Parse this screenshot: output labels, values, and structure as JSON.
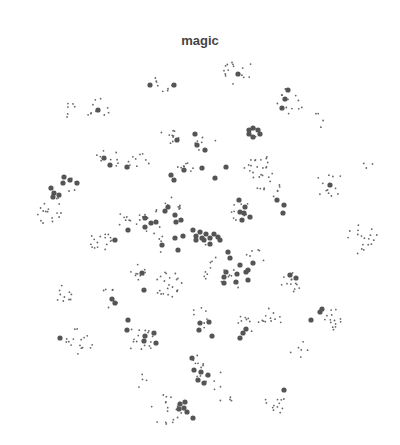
{
  "chart_data": {
    "type": "scatter",
    "title": "magic",
    "xlabel": "",
    "ylabel": "",
    "grid": false,
    "legend": null,
    "axes_visible": false,
    "colors": {
      "small_point": "#666666",
      "large_point": "#555555"
    },
    "clusters": [
      {
        "cx": 236,
        "cy": 70,
        "n": 16,
        "spread": 16,
        "large": [
          [
            238,
            74
          ]
        ]
      },
      {
        "cx": 162,
        "cy": 80,
        "n": 8,
        "spread": 12,
        "large": [
          [
            150,
            85
          ],
          [
            174,
            85
          ]
        ]
      },
      {
        "cx": 100,
        "cy": 110,
        "n": 10,
        "spread": 14,
        "large": [
          [
            98,
            110
          ]
        ]
      },
      {
        "cx": 68,
        "cy": 110,
        "n": 6,
        "spread": 8,
        "large": []
      },
      {
        "cx": 290,
        "cy": 100,
        "n": 12,
        "spread": 14,
        "large": [
          [
            288,
            90
          ],
          [
            285,
            99
          ],
          [
            282,
            108
          ]
        ]
      },
      {
        "cx": 320,
        "cy": 120,
        "n": 4,
        "spread": 8,
        "large": []
      },
      {
        "cx": 172,
        "cy": 135,
        "n": 10,
        "spread": 12,
        "large": [
          [
            177,
            140
          ]
        ]
      },
      {
        "cx": 205,
        "cy": 140,
        "n": 6,
        "spread": 12,
        "large": [
          [
            195,
            134
          ],
          [
            197,
            145
          ],
          [
            205,
            150
          ]
        ]
      },
      {
        "cx": 256,
        "cy": 133,
        "n": 2,
        "spread": 6,
        "large": [
          [
            249,
            130
          ],
          [
            253,
            128
          ],
          [
            258,
            130
          ],
          [
            260,
            134
          ],
          [
            253,
            137
          ],
          [
            249,
            134
          ]
        ]
      },
      {
        "cx": 108,
        "cy": 158,
        "n": 10,
        "spread": 12,
        "large": [
          [
            104,
            158
          ],
          [
            110,
            165
          ]
        ]
      },
      {
        "cx": 140,
        "cy": 165,
        "n": 10,
        "spread": 12,
        "large": [
          [
            127,
            167
          ]
        ]
      },
      {
        "cx": 258,
        "cy": 165,
        "n": 20,
        "spread": 14,
        "large": [
          [
            226,
            167
          ]
        ]
      },
      {
        "cx": 185,
        "cy": 165,
        "n": 8,
        "spread": 10,
        "large": [
          [
            171,
            175
          ],
          [
            174,
            180
          ],
          [
            184,
            170
          ],
          [
            202,
            168
          ],
          [
            215,
            178
          ]
        ]
      },
      {
        "cx": 330,
        "cy": 185,
        "n": 12,
        "spread": 14,
        "large": [
          [
            330,
            185
          ]
        ]
      },
      {
        "cx": 70,
        "cy": 185,
        "n": 4,
        "spread": 8,
        "large": [
          [
            64,
            177
          ],
          [
            70,
            180
          ],
          [
            77,
            183
          ],
          [
            63,
            183
          ]
        ]
      },
      {
        "cx": 368,
        "cy": 165,
        "n": 3,
        "spread": 6,
        "large": []
      },
      {
        "cx": 52,
        "cy": 210,
        "n": 18,
        "spread": 16,
        "large": [
          [
            51,
            188
          ],
          [
            54,
            193
          ],
          [
            53,
            197
          ],
          [
            59,
            195
          ]
        ]
      },
      {
        "cx": 130,
        "cy": 220,
        "n": 10,
        "spread": 14,
        "large": [
          [
            128,
            230
          ]
        ]
      },
      {
        "cx": 150,
        "cy": 220,
        "n": 8,
        "spread": 12,
        "large": [
          [
            145,
            218
          ],
          [
            151,
            223
          ],
          [
            145,
            227
          ],
          [
            156,
            222
          ]
        ]
      },
      {
        "cx": 175,
        "cy": 205,
        "n": 8,
        "spread": 10,
        "large": [
          [
            168,
            207
          ],
          [
            165,
            211
          ],
          [
            175,
            215
          ],
          [
            176,
            222
          ],
          [
            181,
            220
          ]
        ]
      },
      {
        "cx": 240,
        "cy": 210,
        "n": 10,
        "spread": 12,
        "large": [
          [
            239,
            200
          ],
          [
            245,
            207
          ],
          [
            244,
            213
          ],
          [
            250,
            217
          ],
          [
            242,
            220
          ],
          [
            240,
            212
          ]
        ]
      },
      {
        "cx": 270,
        "cy": 185,
        "n": 12,
        "spread": 14,
        "large": [
          [
            277,
            200
          ],
          [
            283,
            213
          ],
          [
            284,
            205
          ]
        ]
      },
      {
        "cx": 100,
        "cy": 240,
        "n": 16,
        "spread": 12,
        "large": [
          [
            115,
            240
          ]
        ]
      },
      {
        "cx": 205,
        "cy": 235,
        "n": 2,
        "spread": 10,
        "large": [
          [
            193,
            230
          ],
          [
            196,
            236
          ],
          [
            200,
            232
          ],
          [
            202,
            238
          ],
          [
            206,
            234
          ],
          [
            210,
            238
          ],
          [
            214,
            234
          ],
          [
            218,
            237
          ],
          [
            220,
            240
          ],
          [
            204,
            240
          ],
          [
            196,
            240
          ],
          [
            210,
            244
          ]
        ]
      },
      {
        "cx": 160,
        "cy": 240,
        "n": 6,
        "spread": 14,
        "large": [
          [
            162,
            245
          ],
          [
            175,
            238
          ],
          [
            183,
            236
          ],
          [
            178,
            250
          ]
        ]
      },
      {
        "cx": 362,
        "cy": 238,
        "n": 18,
        "spread": 16,
        "large": []
      },
      {
        "cx": 210,
        "cy": 268,
        "n": 8,
        "spread": 12,
        "large": [
          [
            228,
            252
          ],
          [
            230,
            258
          ],
          [
            226,
            272
          ],
          [
            246,
            272
          ]
        ]
      },
      {
        "cx": 255,
        "cy": 258,
        "n": 6,
        "spread": 10,
        "large": [
          [
            248,
            270
          ],
          [
            253,
            263
          ],
          [
            240,
            265
          ]
        ]
      },
      {
        "cx": 140,
        "cy": 270,
        "n": 10,
        "spread": 14,
        "large": [
          [
            142,
            273
          ],
          [
            144,
            290
          ]
        ]
      },
      {
        "cx": 168,
        "cy": 285,
        "n": 22,
        "spread": 14,
        "large": []
      },
      {
        "cx": 230,
        "cy": 280,
        "n": 8,
        "spread": 12,
        "large": [
          [
            224,
            277
          ],
          [
            237,
            274
          ],
          [
            224,
            283
          ],
          [
            236,
            282
          ],
          [
            248,
            280
          ]
        ]
      },
      {
        "cx": 292,
        "cy": 280,
        "n": 12,
        "spread": 12,
        "large": [
          [
            290,
            275
          ],
          [
            296,
            278
          ]
        ]
      },
      {
        "cx": 68,
        "cy": 295,
        "n": 10,
        "spread": 12,
        "large": []
      },
      {
        "cx": 110,
        "cy": 298,
        "n": 6,
        "spread": 10,
        "large": [
          [
            112,
            299
          ],
          [
            115,
            303
          ]
        ]
      },
      {
        "cx": 200,
        "cy": 318,
        "n": 8,
        "spread": 12,
        "large": [
          [
            200,
            323
          ],
          [
            209,
            322
          ],
          [
            199,
            330
          ],
          [
            212,
            336
          ]
        ]
      },
      {
        "cx": 243,
        "cy": 325,
        "n": 8,
        "spread": 12,
        "large": [
          [
            243,
            333
          ],
          [
            246,
            329
          ],
          [
            240,
            338
          ]
        ]
      },
      {
        "cx": 270,
        "cy": 320,
        "n": 12,
        "spread": 12,
        "large": []
      },
      {
        "cx": 335,
        "cy": 318,
        "n": 14,
        "spread": 12,
        "large": [
          [
            320,
            312
          ],
          [
            322,
            309
          ],
          [
            311,
            320
          ]
        ]
      },
      {
        "cx": 80,
        "cy": 340,
        "n": 16,
        "spread": 14,
        "large": [
          [
            60,
            338
          ]
        ]
      },
      {
        "cx": 140,
        "cy": 340,
        "n": 16,
        "spread": 14,
        "large": [
          [
            128,
            320
          ],
          [
            127,
            330
          ],
          [
            145,
            336
          ],
          [
            154,
            333
          ],
          [
            144,
            341
          ],
          [
            156,
            343
          ]
        ]
      },
      {
        "cx": 215,
        "cy": 380,
        "n": 6,
        "spread": 10,
        "large": []
      },
      {
        "cx": 300,
        "cy": 350,
        "n": 6,
        "spread": 10,
        "large": []
      },
      {
        "cx": 196,
        "cy": 365,
        "n": 10,
        "spread": 12,
        "large": [
          [
            192,
            358
          ],
          [
            194,
            370
          ],
          [
            201,
            372
          ],
          [
            208,
            375
          ],
          [
            198,
            380
          ],
          [
            204,
            383
          ]
        ]
      },
      {
        "cx": 166,
        "cy": 410,
        "n": 18,
        "spread": 16,
        "large": [
          [
            180,
            404
          ],
          [
            184,
            408
          ],
          [
            187,
            412
          ],
          [
            179,
            409
          ],
          [
            185,
            402
          ],
          [
            193,
            418
          ]
        ]
      },
      {
        "cx": 275,
        "cy": 405,
        "n": 12,
        "spread": 12,
        "large": [
          [
            284,
            390
          ]
        ]
      },
      {
        "cx": 140,
        "cy": 380,
        "n": 4,
        "spread": 8,
        "large": []
      },
      {
        "cx": 226,
        "cy": 400,
        "n": 4,
        "spread": 6,
        "large": []
      }
    ]
  }
}
